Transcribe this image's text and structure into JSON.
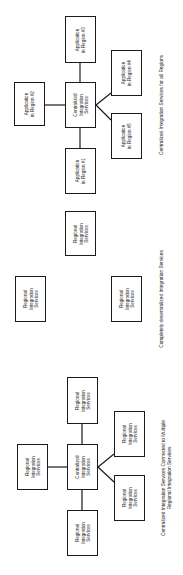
{
  "diagrams": [
    {
      "id": "centralized-all-regions",
      "caption": "Centralized Integration Services for all Regions",
      "center": "Centralized\nIntegration\nServices",
      "nodes": [
        "Application\nin Region #1",
        "Application\nin Region #2",
        "Application\nin Region #3",
        "Application\nin Region #4",
        "Application\nin Region #5"
      ]
    },
    {
      "id": "decentralized",
      "caption": "Completely decentralized Integration Services",
      "nodes": [
        "Regional\nIntegration\nServices",
        "Regional\nIntegration\nServices",
        "Regional\nIntegration\nServices"
      ]
    },
    {
      "id": "centralized-multiple-regional",
      "caption": "Centralized Integration Services Connected to Multiple\nRegional Integration Services",
      "center": "Centralized\nIntegration\nServices",
      "nodes": [
        "Regional\nIntegration\nServices",
        "Regional\nIntegration\nServices",
        "Regional\nIntegration\nServices",
        "Regional\nIntegration\nServices",
        "Regional\nIntegration\nServices"
      ]
    }
  ]
}
